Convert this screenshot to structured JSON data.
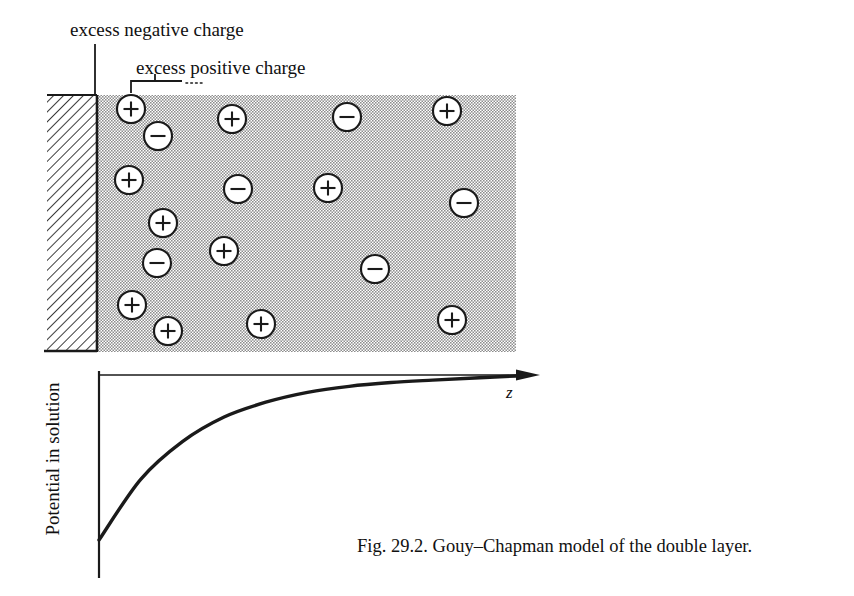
{
  "figure": {
    "caption": "Fig. 29.2.  Gouy–Chapman model of the double layer.",
    "annotations": {
      "negative_charge_label": "excess negative charge",
      "positive_charge_label": "excess positive charge"
    }
  },
  "plot": {
    "y_axis_label": "Potential in solution",
    "x_axis_label": "z"
  },
  "colors": {
    "ink": "#1a1a1a",
    "solution_shading": "#c9c9c9",
    "electrode_fill": "#ffffff",
    "ion_fill": "#ffffff",
    "page_background": "#ffffff"
  },
  "diagram": {
    "electrode": {
      "x": 47,
      "y": 95,
      "width": 50,
      "height": 257,
      "hatch": "diagonal"
    },
    "solution": {
      "x": 97,
      "y": 95,
      "width": 419,
      "height": 257
    },
    "ion_radius": 14,
    "ions": [
      {
        "sign": "+",
        "cx": 131,
        "cy": 109
      },
      {
        "sign": "-",
        "cx": 158,
        "cy": 136
      },
      {
        "sign": "+",
        "cx": 232,
        "cy": 119
      },
      {
        "sign": "-",
        "cx": 347,
        "cy": 117
      },
      {
        "sign": "+",
        "cx": 447,
        "cy": 111
      },
      {
        "sign": "+",
        "cx": 129,
        "cy": 180
      },
      {
        "sign": "-",
        "cx": 238,
        "cy": 189
      },
      {
        "sign": "+",
        "cx": 328,
        "cy": 188
      },
      {
        "sign": "-",
        "cx": 464,
        "cy": 203
      },
      {
        "sign": "+",
        "cx": 163,
        "cy": 223
      },
      {
        "sign": "+",
        "cx": 224,
        "cy": 251
      },
      {
        "sign": "-",
        "cx": 157,
        "cy": 263
      },
      {
        "sign": "-",
        "cx": 375,
        "cy": 269
      },
      {
        "sign": "+",
        "cx": 132,
        "cy": 305
      },
      {
        "sign": "+",
        "cx": 168,
        "cy": 331
      },
      {
        "sign": "+",
        "cx": 261,
        "cy": 324
      },
      {
        "sign": "+",
        "cx": 452,
        "cy": 320
      }
    ]
  },
  "chart_data": {
    "type": "line",
    "title": "",
    "xlabel": "z",
    "ylabel": "Potential in solution",
    "x": [
      0,
      0.1,
      0.2,
      0.3,
      0.4,
      0.5,
      0.6,
      0.7,
      0.8,
      0.9,
      1.0
    ],
    "y": [
      -1.0,
      -0.63,
      -0.4,
      -0.25,
      -0.16,
      -0.1,
      -0.063,
      -0.04,
      -0.025,
      -0.012,
      0.0
    ],
    "xlim": [
      0,
      1.0
    ],
    "ylim": [
      -1.0,
      0.0
    ],
    "grid": false,
    "legend": false,
    "axis_origin_at_top": true
  }
}
